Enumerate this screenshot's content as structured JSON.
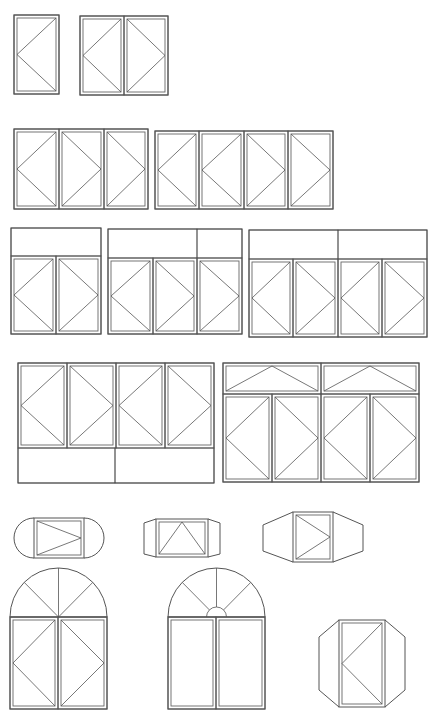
{
  "diagram": {
    "stroke_color": "#555555",
    "background": "#ffffff",
    "rows": [
      {
        "name": "row-1-casements",
        "groups": [
          {
            "name": "single-casement",
            "frame": [
              14,
              15,
              45,
              79
            ],
            "sashes": [
              {
                "box": [
                  14,
                  15,
                  45,
                  79
                ],
                "hinge": "left"
              }
            ]
          },
          {
            "name": "double-casement",
            "frame": [
              80,
              16,
              88,
              79
            ],
            "sashes": [
              {
                "box": [
                  80,
                  16,
                  44,
                  79
                ],
                "hinge": "left"
              },
              {
                "box": [
                  124,
                  16,
                  44,
                  79
                ],
                "hinge": "right"
              }
            ]
          }
        ]
      },
      {
        "name": "row-2-multi-casements",
        "groups": [
          {
            "name": "triple-casement",
            "frame": [
              14,
              129,
              134,
              80
            ],
            "sashes": [
              {
                "box": [
                  14,
                  129,
                  45,
                  80
                ],
                "hinge": "left"
              },
              {
                "box": [
                  59,
                  129,
                  45,
                  80
                ],
                "hinge": "right"
              },
              {
                "box": [
                  104,
                  129,
                  44,
                  80
                ],
                "hinge": "right"
              }
            ]
          },
          {
            "name": "quad-casement",
            "frame": [
              155,
              131,
              178,
              78
            ],
            "sashes": [
              {
                "box": [
                  155,
                  131,
                  44,
                  78
                ],
                "hinge": "left"
              },
              {
                "box": [
                  199,
                  131,
                  45,
                  78
                ],
                "hinge": "left"
              },
              {
                "box": [
                  244,
                  131,
                  44,
                  78
                ],
                "hinge": "right"
              },
              {
                "box": [
                  288,
                  131,
                  45,
                  78
                ],
                "hinge": "right"
              }
            ]
          }
        ]
      },
      {
        "name": "row-3-transom-casements",
        "groups": [
          {
            "name": "double-with-transom",
            "frame": [
              11,
              228,
              90,
              106
            ],
            "transoms": [
              [
                11,
                228,
                90,
                28
              ]
            ],
            "sashes": [
              {
                "box": [
                  11,
                  256,
                  45,
                  78
                ],
                "hinge": "left"
              },
              {
                "box": [
                  56,
                  256,
                  45,
                  78
                ],
                "hinge": "right"
              }
            ]
          },
          {
            "name": "triple-with-transom",
            "frame": [
              108,
              229,
              134,
              105
            ],
            "transoms": [
              [
                108,
                229,
                89,
                29
              ],
              [
                197,
                229,
                45,
                29
              ]
            ],
            "sashes": [
              {
                "box": [
                  108,
                  258,
                  45,
                  76
                ],
                "hinge": "left"
              },
              {
                "box": [
                  153,
                  258,
                  44,
                  76
                ],
                "hinge": "right"
              },
              {
                "box": [
                  197,
                  258,
                  45,
                  76
                ],
                "hinge": "right"
              }
            ]
          },
          {
            "name": "quad-with-transom",
            "frame": [
              249,
              230,
              178,
              107
            ],
            "transoms": [
              [
                249,
                230,
                89,
                29
              ],
              [
                338,
                230,
                89,
                29
              ]
            ],
            "sashes": [
              {
                "box": [
                  249,
                  259,
                  44,
                  78
                ],
                "hinge": "left"
              },
              {
                "box": [
                  293,
                  259,
                  45,
                  78
                ],
                "hinge": "right"
              },
              {
                "box": [
                  338,
                  259,
                  44,
                  78
                ],
                "hinge": "left"
              },
              {
                "box": [
                  382,
                  259,
                  45,
                  78
                ],
                "hinge": "right"
              }
            ]
          }
        ]
      },
      {
        "name": "row-4-large-units",
        "groups": [
          {
            "name": "quad-with-bottom-panels",
            "frame": [
              18,
              363,
              196,
              120
            ],
            "bottom_panels": [
              [
                18,
                448,
                97,
                35
              ],
              [
                115,
                448,
                99,
                35
              ]
            ],
            "sashes": [
              {
                "box": [
                  18,
                  363,
                  49,
                  85
                ],
                "hinge": "left"
              },
              {
                "box": [
                  67,
                  363,
                  49,
                  85
                ],
                "hinge": "right"
              },
              {
                "box": [
                  116,
                  363,
                  49,
                  85
                ],
                "hinge": "left"
              },
              {
                "box": [
                  165,
                  363,
                  49,
                  85
                ],
                "hinge": "right"
              }
            ]
          },
          {
            "name": "quad-with-top-hoppers",
            "frame": [
              223,
              363,
              196,
              119
            ],
            "top_hoppers": [
              [
                223,
                363,
                98,
                31
              ],
              [
                321,
                363,
                98,
                31
              ]
            ],
            "sashes": [
              {
                "box": [
                  223,
                  394,
                  49,
                  88
                ],
                "hinge": "left"
              },
              {
                "box": [
                  272,
                  394,
                  49,
                  88
                ],
                "hinge": "right"
              },
              {
                "box": [
                  321,
                  394,
                  49,
                  88
                ],
                "hinge": "left"
              },
              {
                "box": [
                  370,
                  394,
                  49,
                  88
                ],
                "hinge": "right"
              }
            ]
          }
        ]
      },
      {
        "name": "row-5-bay-windows",
        "groups": [
          {
            "name": "rounded-bay",
            "center_sash": [
              34,
              518,
              50,
              40
            ],
            "hinge": "right",
            "style": "round-ends"
          },
          {
            "name": "angled-bay",
            "center_sash": [
              156,
              519,
              52,
              38
            ],
            "hinge": "top",
            "style": "trapezoid-ends"
          },
          {
            "name": "wide-angled-bay",
            "center_sash": [
              293,
              512,
              40,
              50
            ],
            "hinge": "right",
            "style": "wide-trapezoid-ends"
          }
        ]
      },
      {
        "name": "row-6-arched-and-octagon",
        "groups": [
          {
            "name": "arched-double-casement",
            "frame": [
              10,
              617,
              97,
              92
            ],
            "arch_radius": 49,
            "arch_spokes": 4,
            "sashes": [
              {
                "box": [
                  10,
                  617,
                  48,
                  92
                ],
                "hinge": "left"
              },
              {
                "box": [
                  58,
                  617,
                  49,
                  92
                ],
                "hinge": "right"
              }
            ]
          },
          {
            "name": "arched-fixed-with-fan",
            "frame": [
              168,
              617,
              97,
              92
            ],
            "arch_radius": 49,
            "arch_spokes": 4,
            "hub_radius": 10,
            "fixed_panes": [
              [
                168,
                617,
                48,
                92
              ],
              [
                216,
                617,
                49,
                92
              ]
            ]
          },
          {
            "name": "octagonal-casement",
            "sash": [
              339,
              620,
              46,
              87
            ],
            "hinge": "left",
            "style": "octagon"
          }
        ]
      }
    ]
  }
}
